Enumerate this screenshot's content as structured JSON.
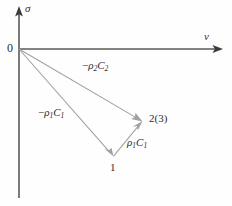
{
  "figure": {
    "type": "vector-diagram",
    "background_color": "#fefefe",
    "axis_color": "#5a5a5a",
    "vector_color": "#a0a0a0",
    "text_color": "#2e2e2e"
  },
  "axes": {
    "vertical": {
      "label": "σ",
      "name": "sigma-axis",
      "direction": "up",
      "origin_px": [
        19,
        49
      ],
      "tip_px": [
        19,
        8
      ],
      "tail_px": [
        19,
        198
      ]
    },
    "horizontal": {
      "label": "v",
      "name": "v-axis",
      "direction": "right",
      "origin_px": [
        19,
        49
      ],
      "tip_px": [
        222,
        49
      ]
    }
  },
  "origin": {
    "label": "0"
  },
  "points": [
    {
      "id": "p1",
      "label": "1",
      "px": [
        113,
        156
      ]
    },
    {
      "id": "p23",
      "label": "2(3)",
      "px": [
        142,
        121
      ]
    }
  ],
  "vectors": [
    {
      "id": "v_rho2c2",
      "label_plain": "-ρ₂C₂",
      "sign": "−",
      "rho": "ρ",
      "rho_sub": "2",
      "c": "C",
      "c_sub": "2",
      "from_px": [
        19,
        49
      ],
      "to_px": [
        142,
        121
      ],
      "label_px": [
        82,
        64
      ]
    },
    {
      "id": "v_rho1c1_neg",
      "label_plain": "-ρ₁C₁",
      "sign": "−",
      "rho": "ρ",
      "rho_sub": "1",
      "c": "C",
      "c_sub": "1",
      "from_px": [
        19,
        49
      ],
      "to_px": [
        113,
        156
      ],
      "label_px": [
        38,
        110
      ]
    },
    {
      "id": "v_rho1c1_pos",
      "label_plain": "ρ₁C₁",
      "sign": "",
      "rho": "ρ",
      "rho_sub": "1",
      "c": "C",
      "c_sub": "1",
      "from_px": [
        113,
        156
      ],
      "to_px": [
        142,
        121
      ],
      "label_px": [
        127,
        140
      ]
    }
  ]
}
